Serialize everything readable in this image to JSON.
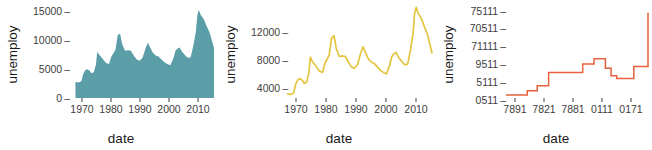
{
  "figure": {
    "background": "#ffffff",
    "panel_count": 3
  },
  "chart_data": [
    {
      "type": "area",
      "title": "",
      "xlabel": "date",
      "ylabel": "unemploy",
      "color": "#5c9ea8",
      "grid": false,
      "legend": "none",
      "xlim": [
        1967,
        2015
      ],
      "ylim": [
        0,
        16000
      ],
      "ytick_labels": [
        "0",
        "5000",
        "10000",
        "15000"
      ],
      "ytick_values": [
        0,
        5000,
        10000,
        15000
      ],
      "xtick_labels": [
        "1970",
        "1980",
        "1990",
        "2000",
        "2010"
      ],
      "xtick_values": [
        1970,
        1980,
        1990,
        2000,
        2010
      ],
      "x": [
        1967.5,
        1968.5,
        1969.5,
        1970.2,
        1970.8,
        1971.5,
        1972.3,
        1973.0,
        1973.8,
        1974.5,
        1975.0,
        1975.5,
        1976.2,
        1977.0,
        1978.0,
        1979.0,
        1979.8,
        1980.5,
        1981.2,
        1982.0,
        1982.8,
        1983.5,
        1984.5,
        1985.5,
        1986.5,
        1987.5,
        1988.5,
        1989.5,
        1990.5,
        1991.5,
        1992.3,
        1993.0,
        1994.0,
        1995.0,
        1996.0,
        1997.0,
        1998.0,
        1999.0,
        2000.0,
        2001.0,
        2001.8,
        2002.5,
        2003.2,
        2004.0,
        2005.0,
        2006.0,
        2007.0,
        2008.0,
        2008.8,
        2009.3,
        2009.8,
        2010.5,
        2011.5,
        2012.5,
        2013.5,
        2014.5,
        2015.0
      ],
      "y": [
        2800,
        2700,
        2900,
        4200,
        4800,
        5000,
        4800,
        4300,
        4500,
        5800,
        8100,
        7600,
        7200,
        6700,
        6100,
        5900,
        7200,
        7800,
        8400,
        10900,
        11200,
        9400,
        8200,
        8300,
        8200,
        7400,
        6700,
        6500,
        7000,
        8600,
        9600,
        8900,
        7900,
        7400,
        7200,
        6700,
        6200,
        5900,
        5700,
        6800,
        8200,
        8600,
        8800,
        8100,
        7500,
        7000,
        7100,
        9300,
        11600,
        14500,
        15300,
        14400,
        13700,
        12500,
        11400,
        9600,
        8700
      ]
    },
    {
      "type": "line",
      "title": "",
      "xlabel": "date",
      "ylabel": "unemploy",
      "color": "#e3c53f",
      "grid": false,
      "legend": "none",
      "xlim": [
        1967,
        2015
      ],
      "ylim": [
        2200,
        15500
      ],
      "ytick_labels": [
        "4000",
        "8000",
        "12000"
      ],
      "ytick_values": [
        4000,
        8000,
        12000
      ],
      "xtick_labels": [
        "1970",
        "1980",
        "1990",
        "2000",
        "2010"
      ],
      "xtick_values": [
        1970,
        1980,
        1990,
        2000,
        2010
      ],
      "x": [
        1967.5,
        1968.5,
        1969.5,
        1970.2,
        1970.8,
        1971.5,
        1972.3,
        1973.0,
        1973.8,
        1974.5,
        1975.0,
        1975.5,
        1976.2,
        1977.0,
        1978.0,
        1979.0,
        1979.8,
        1980.5,
        1981.2,
        1982.0,
        1982.8,
        1983.5,
        1984.5,
        1985.5,
        1986.5,
        1987.5,
        1988.5,
        1989.5,
        1990.5,
        1991.5,
        1992.3,
        1993.0,
        1994.0,
        1995.0,
        1996.0,
        1997.0,
        1998.0,
        1999.0,
        2000.0,
        2001.0,
        2001.8,
        2002.5,
        2003.2,
        2004.0,
        2005.0,
        2006.0,
        2007.0,
        2008.0,
        2008.8,
        2009.3,
        2009.8,
        2010.5,
        2011.5,
        2012.5,
        2013.5,
        2014.5,
        2015.0
      ],
      "y": [
        2800,
        2700,
        2900,
        4200,
        4800,
        5000,
        4800,
        4300,
        4500,
        5800,
        8100,
        7600,
        7200,
        6700,
        6100,
        5900,
        7200,
        7800,
        8400,
        10900,
        11200,
        9400,
        8200,
        8300,
        8200,
        7400,
        6700,
        6500,
        7000,
        8600,
        9600,
        8900,
        7900,
        7400,
        7200,
        6700,
        6200,
        5900,
        5700,
        6800,
        8200,
        8600,
        8800,
        8100,
        7500,
        7000,
        7100,
        9300,
        11600,
        14500,
        15300,
        14400,
        13700,
        12500,
        11400,
        9600,
        8700
      ]
    },
    {
      "type": "line",
      "title": "",
      "xlabel": "date",
      "ylabel": "unemploy",
      "color": "#e8603c",
      "grid": false,
      "legend": "none",
      "step": true,
      "ytick_labels": [
        "0511",
        "5111",
        "9511",
        "71111",
        "70511",
        "75111"
      ],
      "ytick_positions": [
        0,
        1,
        2,
        3,
        4,
        5
      ],
      "xtick_labels": [
        "7891",
        "7821",
        "7881",
        "0111",
        "0171"
      ],
      "xtick_positions": [
        0,
        1,
        2,
        3,
        4
      ],
      "x": [
        0.0,
        0.08,
        0.15,
        0.22,
        0.3,
        0.38,
        0.46,
        0.54,
        0.62,
        0.7,
        0.74,
        0.78,
        0.82,
        0.86,
        0.9,
        0.94,
        1.0
      ],
      "y": [
        0.18,
        0.18,
        0.42,
        0.72,
        1.5,
        1.5,
        1.5,
        2.0,
        2.3,
        1.75,
        1.3,
        1.15,
        1.15,
        1.15,
        1.85,
        1.85,
        5.0
      ]
    }
  ]
}
